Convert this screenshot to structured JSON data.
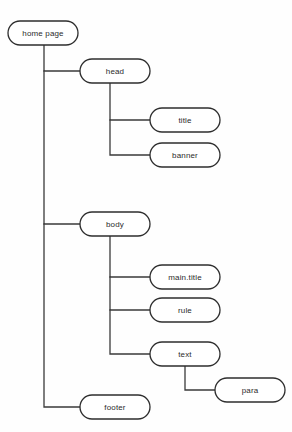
{
  "diagram": {
    "type": "tree",
    "background_color": "#fefefe",
    "node_fill": "#ffffff",
    "node_stroke": "#2e2e2e",
    "edge_color": "#3a3a3a",
    "text_color": "#2b2b2b",
    "nodes": [
      {
        "id": "home_page",
        "label": "home page",
        "x": 8,
        "y": 21,
        "w": 70,
        "h": 24,
        "level": 0
      },
      {
        "id": "head",
        "label": "head",
        "x": 80,
        "y": 59,
        "w": 70,
        "h": 24,
        "level": 1
      },
      {
        "id": "title",
        "label": "title",
        "x": 150,
        "y": 108,
        "w": 70,
        "h": 24,
        "level": 2
      },
      {
        "id": "banner",
        "label": "banner",
        "x": 150,
        "y": 143,
        "w": 70,
        "h": 24,
        "level": 2
      },
      {
        "id": "body",
        "label": "body",
        "x": 80,
        "y": 212,
        "w": 70,
        "h": 24,
        "level": 1
      },
      {
        "id": "main_title",
        "label": "main.title",
        "x": 150,
        "y": 265,
        "w": 70,
        "h": 24,
        "level": 2
      },
      {
        "id": "rule",
        "label": "rule",
        "x": 150,
        "y": 298,
        "w": 70,
        "h": 24,
        "level": 2
      },
      {
        "id": "text",
        "label": "text",
        "x": 150,
        "y": 342,
        "w": 70,
        "h": 24,
        "level": 2
      },
      {
        "id": "para",
        "label": "para",
        "x": 215,
        "y": 378,
        "w": 70,
        "h": 24,
        "level": 3
      },
      {
        "id": "footer",
        "label": "footer",
        "x": 80,
        "y": 395,
        "w": 70,
        "h": 24,
        "level": 1
      }
    ],
    "edges": [
      {
        "from": "home_page",
        "to": "head",
        "path": "M 44 45 L 44 71 L 80 71"
      },
      {
        "from": "home_page",
        "to": "body",
        "path": "M 44 71 L 44 224 L 80 224"
      },
      {
        "from": "home_page",
        "to": "footer",
        "path": "M 44 224 L 44 407 L 80 407"
      },
      {
        "from": "head",
        "to": "title",
        "path": "M 110 83 L 110 120 L 150 120"
      },
      {
        "from": "head",
        "to": "banner",
        "path": "M 110 120 L 110 155 L 150 155"
      },
      {
        "from": "body",
        "to": "main_title",
        "path": "M 110 236 L 110 277 L 150 277"
      },
      {
        "from": "body",
        "to": "rule",
        "path": "M 110 277 L 110 310 L 150 310"
      },
      {
        "from": "body",
        "to": "text",
        "path": "M 110 310 L 110 354 L 150 354"
      },
      {
        "from": "text",
        "to": "para",
        "path": "M 185 366 L 185 390 L 215 390"
      }
    ]
  }
}
